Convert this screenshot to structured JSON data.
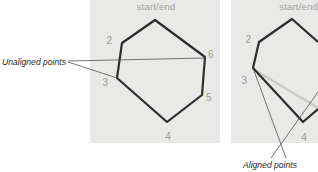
{
  "colors": {
    "panel": "#e9e9e7",
    "polygon_stroke": "#2d2d2d",
    "ghost_stroke": "#c9c9c6",
    "vertex_label": "#9b9b99",
    "title_label": "#a3a3a1",
    "annotation_text": "#1f1f1f",
    "leader_line": "#4a4a4a"
  },
  "left_figure": {
    "title": "start/end",
    "annotation": "Unaligned points",
    "vertex_labels": {
      "v2": "2",
      "v3": "3",
      "v4": "4",
      "v5": "5",
      "v6": "6"
    }
  },
  "right_figure": {
    "title": "start/end",
    "annotation": "Aligned points",
    "vertex_labels": {
      "v2": "2",
      "v3": "3",
      "v4": "4"
    }
  }
}
